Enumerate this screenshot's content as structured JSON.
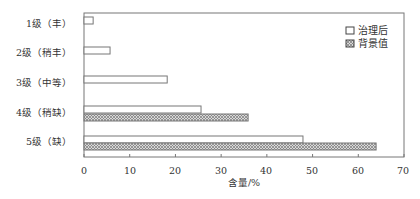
{
  "chart_data": {
    "type": "bar",
    "orientation": "horizontal",
    "title": "",
    "xlabel": "含量/%",
    "ylabel": "",
    "xlim": [
      0,
      70
    ],
    "xticks": [
      0,
      10,
      20,
      30,
      40,
      50,
      60,
      70
    ],
    "grid": false,
    "legend_position": "upper right",
    "categories": [
      "1级（丰）",
      "2级（稍丰）",
      "3级（中等）",
      "4级（稍缺）",
      "5级（缺）"
    ],
    "series": [
      {
        "name": "治理后",
        "style": "white-fill",
        "values": [
          2.0,
          5.7,
          18.2,
          25.6,
          47.9
        ]
      },
      {
        "name": "背景值",
        "style": "hatched",
        "values": [
          0,
          0,
          0,
          35.9,
          63.9
        ]
      }
    ]
  },
  "legend": {
    "items": [
      {
        "label": "治理后",
        "icon": "white-box-icon"
      },
      {
        "label": "背景值",
        "icon": "hatched-box-icon"
      }
    ]
  },
  "axis": {
    "x_title": "含量/%",
    "tick_labels": [
      "0",
      "10",
      "20",
      "30",
      "40",
      "50",
      "60",
      "70"
    ]
  },
  "categories": {
    "labels": [
      "1级（丰）",
      "2级（稍丰）",
      "3级（中等）",
      "4级（稍缺）",
      "5级（缺）"
    ]
  }
}
